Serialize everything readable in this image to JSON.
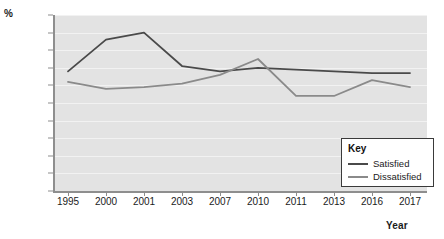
{
  "chart_data": {
    "type": "line",
    "title": "",
    "xlabel": "Year",
    "ylabel": "%",
    "categories": [
      "1995",
      "2000",
      "2001",
      "2003",
      "2007",
      "2010",
      "2011",
      "2013",
      "2016",
      "2017"
    ],
    "ylim": [
      0,
      50
    ],
    "ytick_step": 5,
    "yticks": [
      "0",
      "5",
      "10",
      "15",
      "20",
      "25",
      "30",
      "35",
      "40",
      "45",
      "50"
    ],
    "grid": true,
    "legend_position": "bottom-right",
    "legend_title": "Key",
    "series": [
      {
        "name": "Satisfied",
        "color": "#4a4a4a",
        "values": [
          34,
          43,
          45,
          35.5,
          34,
          35,
          34.5,
          34,
          33.5,
          33.5
        ]
      },
      {
        "name": "Dissatisfied",
        "color": "#8a8a8a",
        "values": [
          31,
          29,
          29.5,
          30.5,
          33,
          37.5,
          27,
          27,
          31.5,
          29.5
        ]
      }
    ]
  },
  "axes": {
    "y_title": "%",
    "x_title": "Year"
  }
}
